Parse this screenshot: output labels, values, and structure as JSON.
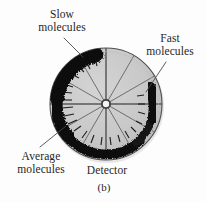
{
  "figure": {
    "caption": "(b)",
    "panel_id": "b",
    "background_color": "#fdfdfd"
  },
  "labels": {
    "slow_molecules": {
      "line1": "Slow",
      "line2": "molecules"
    },
    "fast_molecules": {
      "line1": "Fast",
      "line2": "molecules"
    },
    "average_molecules": {
      "line1": "Average",
      "line2": "molecules"
    },
    "detector": {
      "line1": "Detector"
    }
  },
  "disk": {
    "center_x": 106,
    "center_y": 104,
    "radius": 56,
    "fill_color": "#c9c9c9",
    "outline_color": "#4a4a4a",
    "hub_radius": 4,
    "hub_color": "#f2f2f2",
    "spoke_color": "#6b6b6b",
    "spoke_count": 12
  },
  "deposit": {
    "color": "#0d0d0d",
    "label": "molecular deposit arc",
    "start_angle_deg": 108,
    "end_angle_deg": 355,
    "max_thickness": 15,
    "min_thickness": 6
  },
  "leader_lines": {
    "slow": "slow-molecules-leader",
    "fast": "fast-molecules-leader",
    "average": "average-molecules-leader"
  },
  "colors": {
    "text": "#262626",
    "disk_gray": "#c9c9c9",
    "deposit_black": "#0d0d0d",
    "leader_gray": "#555555"
  }
}
